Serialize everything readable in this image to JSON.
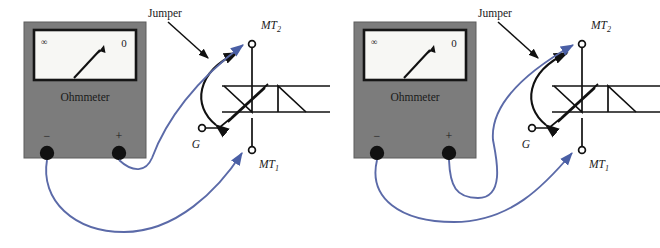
{
  "figure": {
    "background_color": "#ffffff",
    "panel_count": 2
  },
  "colors": {
    "meter_body": "#7c7c7c",
    "meter_body_dark": "#6e6e6e",
    "meter_face": "#f7f7f4",
    "meter_bezel": "#151515",
    "terminal_post": "#111111",
    "lead_wire": "#5b6aa8",
    "jumper_wire": "#111111",
    "symbol_line": "#111111",
    "text": "#1a1a1a"
  },
  "panels": [
    {
      "id": "left",
      "name": "triac-test-step-1",
      "meter": {
        "label": "Ohmmeter",
        "scale_left": "∞",
        "scale_right": "0",
        "needle_direction": "up-right",
        "terminals": [
          {
            "name": "negative",
            "sign": "−"
          },
          {
            "name": "positive",
            "sign": "+"
          }
        ]
      },
      "device": {
        "type": "TRIAC",
        "terminals": [
          {
            "name": "main-terminal-2",
            "label": "MT",
            "subscript": "2"
          },
          {
            "name": "main-terminal-1",
            "label": "MT",
            "subscript": "1"
          },
          {
            "name": "gate",
            "label": "G",
            "subscript": ""
          }
        ]
      },
      "annotations": [
        {
          "name": "jumper-label",
          "text": "Jumper"
        }
      ],
      "leads": [
        {
          "name": "negative-lead",
          "from": "meter-negative-terminal",
          "to": "device-mt1"
        },
        {
          "name": "positive-lead",
          "from": "meter-positive-terminal",
          "to": "device-mt2"
        }
      ],
      "jumper": {
        "name": "gate-to-mt2-jumper",
        "from": "gate",
        "to": "main-terminal-2"
      }
    },
    {
      "id": "right",
      "name": "triac-test-step-2",
      "meter": {
        "label": "Ohmmeter",
        "scale_left": "∞",
        "scale_right": "0",
        "needle_direction": "up-right",
        "terminals": [
          {
            "name": "negative",
            "sign": "−"
          },
          {
            "name": "positive",
            "sign": "+"
          }
        ]
      },
      "device": {
        "type": "TRIAC",
        "terminals": [
          {
            "name": "main-terminal-2",
            "label": "MT",
            "subscript": "2"
          },
          {
            "name": "main-terminal-1",
            "label": "MT",
            "subscript": "1"
          },
          {
            "name": "gate",
            "label": "G",
            "subscript": ""
          }
        ]
      },
      "annotations": [
        {
          "name": "jumper-label",
          "text": "Jumper"
        }
      ],
      "leads": [
        {
          "name": "negative-lead",
          "from": "meter-negative-terminal",
          "to": "device-mt2"
        },
        {
          "name": "positive-lead",
          "from": "meter-positive-terminal",
          "to": "device-mt1"
        }
      ],
      "jumper": {
        "name": "gate-to-mt2-jumper",
        "from": "gate",
        "to": "main-terminal-2"
      }
    }
  ]
}
